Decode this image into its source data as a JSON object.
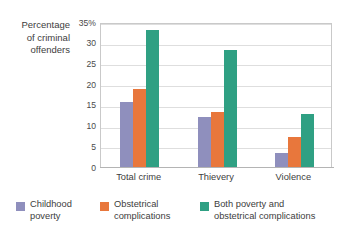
{
  "chart_data": {
    "type": "bar",
    "title": "",
    "subtitle": "",
    "xlabel": "",
    "ylabel": "Percentage of criminal offenders",
    "ylabel_lines": [
      "Percentage",
      "of criminal",
      "offenders"
    ],
    "categories": [
      "Total crime",
      "Thievery",
      "Violence"
    ],
    "series": [
      {
        "name": "Childhood poverty",
        "color": "#8f8fbd",
        "values": [
          15.7,
          12.1,
          3.4
        ]
      },
      {
        "name": "Obstetrical complications",
        "color": "#e8773c",
        "values": [
          18.9,
          13.3,
          7.3
        ]
      },
      {
        "name": "Both poverty and obstetrical complications",
        "color": "#2fa083",
        "values": [
          33.0,
          28.2,
          12.7
        ]
      }
    ],
    "ylim": [
      0,
      35
    ],
    "ytick_values": [
      35,
      30,
      25,
      20,
      15,
      10,
      5,
      0
    ],
    "ytick_labels": [
      "35%",
      "30",
      "25",
      "20",
      "15",
      "10",
      "5",
      "0"
    ],
    "grid": true,
    "grid_axis": "y",
    "legend_position": "bottom",
    "legend": [
      {
        "label_lines": [
          "Childhood",
          "poverty"
        ],
        "color": "#8f8fbd"
      },
      {
        "label_lines": [
          "Obstetrical",
          "complications"
        ],
        "color": "#e8773c"
      },
      {
        "label_lines": [
          "Both poverty and",
          "obstetrical complications"
        ],
        "color": "#2fa083"
      }
    ]
  },
  "colors": {
    "childhood_poverty": "#8f8fbd",
    "obstetrical_complications": "#e8773c",
    "both": "#2fa083",
    "gridline": "#dedede",
    "frame": "#c9c9c9",
    "text": "#3d3d3d"
  }
}
